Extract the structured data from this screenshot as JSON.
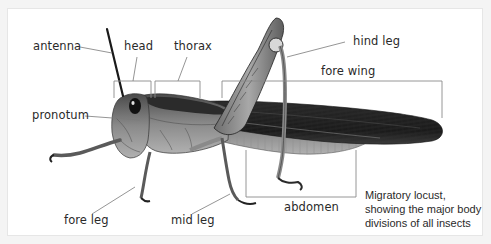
{
  "figure": {
    "subject": "Migratory locust",
    "caption_lines": [
      "Migratory locust,",
      "showing the major body",
      "divisions of all insects"
    ]
  },
  "labels": {
    "antenna": "antenna",
    "head": "head",
    "thorax": "thorax",
    "hind_leg": "hind leg",
    "fore_wing": "fore wing",
    "pronotum": "pronotum",
    "abdomen": "abdomen",
    "fore_leg": "fore leg",
    "mid_leg": "mid leg"
  },
  "colors": {
    "background": "#ffffff",
    "frame_border": "#e6e6e6",
    "leader_line": "#7a7a7a",
    "label_text": "#2a2a2a",
    "insect_dark": "#1e1e1e",
    "insect_mid": "#6a6a6a",
    "insect_light": "#b5b5b5"
  }
}
